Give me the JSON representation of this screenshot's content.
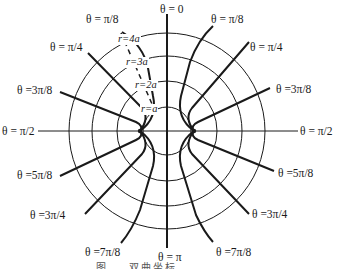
{
  "diagram": {
    "type": "bipolar-style coordinate grid (circles r and curves θ)",
    "colors": {
      "line": "#1a1a1a",
      "background": "#ffffff"
    },
    "theta_labels": {
      "top": "θ = 0",
      "bottom": "θ = π",
      "left_mid": "θ = π/2",
      "right_mid": "θ = π/2",
      "upper_left": [
        "θ = π/8",
        "θ = π/4",
        "θ =3π/8"
      ],
      "upper_right": [
        "θ = π/8",
        "θ = π/4",
        "θ =3π/8"
      ],
      "lower_left": [
        "θ =5π/8",
        "θ =3π/4",
        "θ =7π/8"
      ],
      "lower_right": [
        "θ =5π/8",
        "θ =3π/4",
        "θ =7π/8"
      ]
    },
    "radius_labels": [
      "r=a",
      "r=2a",
      "r=3a",
      "r=4a"
    ],
    "circle_radii_px": [
      24,
      50,
      75,
      98
    ],
    "foci": [
      "left focus",
      "right focus"
    ],
    "caption_partial": "图 … 双曲坐标 …"
  }
}
